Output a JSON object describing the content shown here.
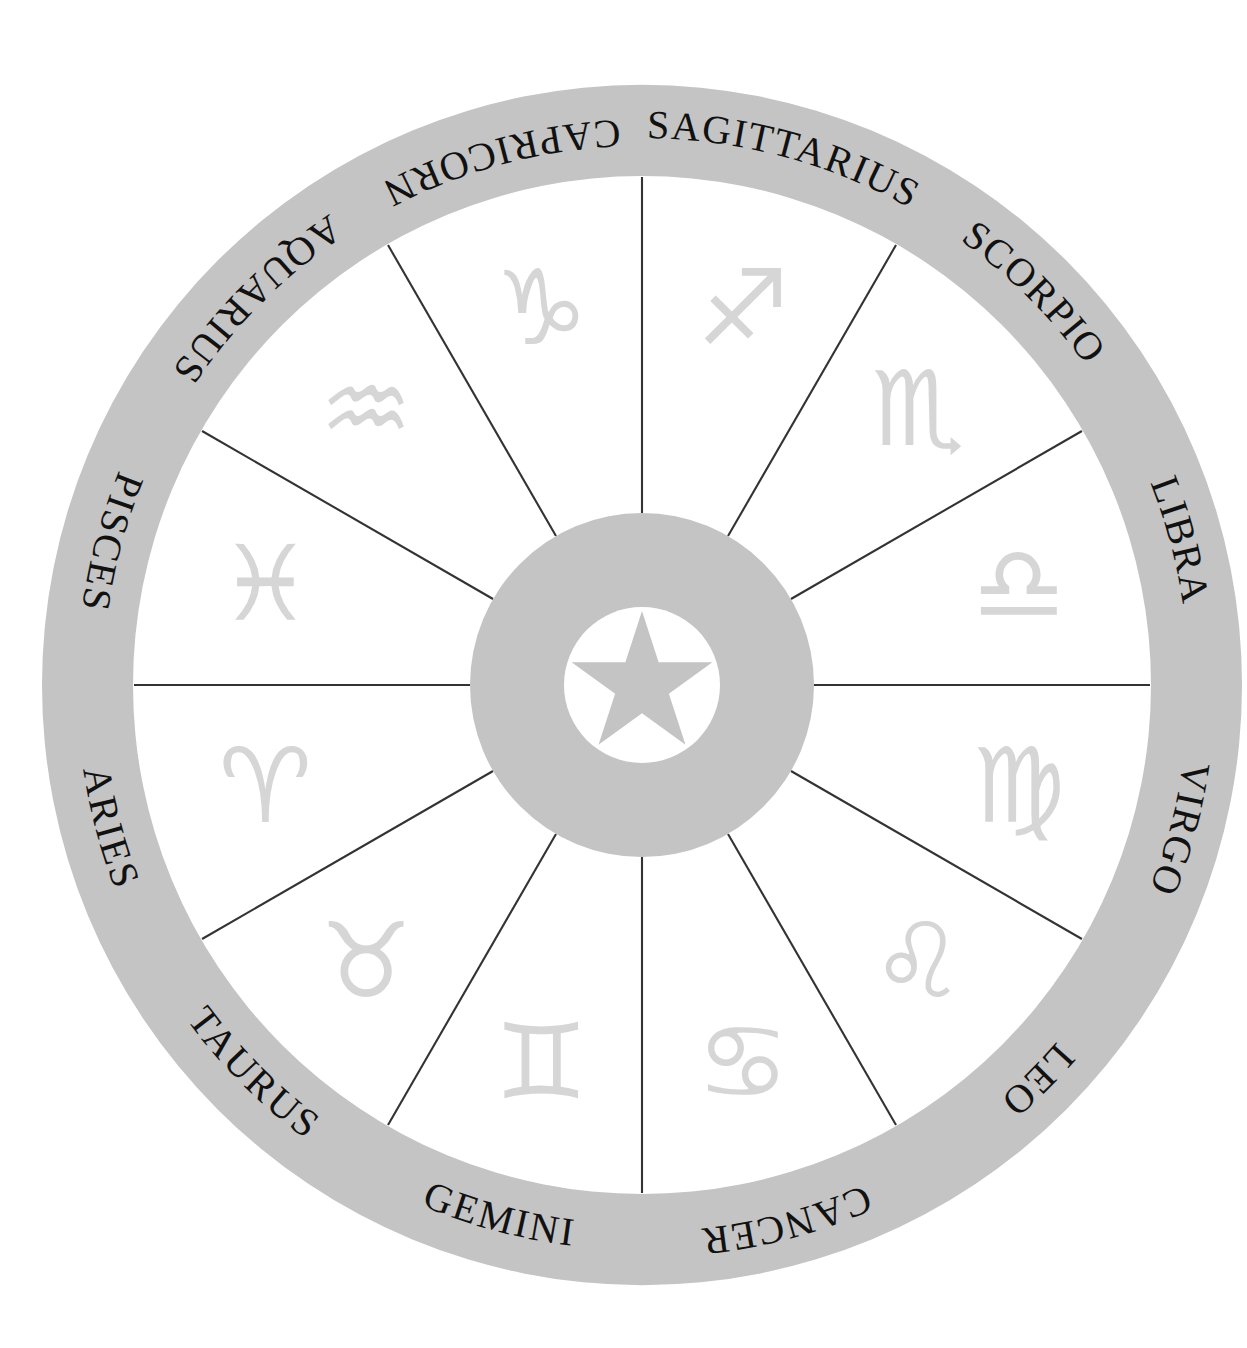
{
  "diagram": {
    "kind": "astrological-zodiac-wheel",
    "segment_count": 12
  },
  "geometry": {
    "center_x": 642,
    "center_y": 685,
    "outer_radius": 600,
    "ring_inner_radius": 508,
    "label_radius": 556,
    "glyph_radius": 390,
    "hub_radius": 172,
    "hub_inner_radius": 78,
    "star_radius": 74,
    "segment_span_degrees": 30,
    "first_segment_start_degrees": 0
  },
  "colors": {
    "background": "#ffffff",
    "ring_band": "#c4c4c4",
    "hub_disc": "#c4c4c4",
    "hub_inner": "#ffffff",
    "hub_star": "#c4c4c4",
    "segment_face": "#ffffff",
    "spoke_line": "#333333",
    "label_text": "#111111",
    "glyph": "#d6d6d6"
  },
  "center_emblem": {
    "name": "five-pointed-star",
    "points": 5
  },
  "signs": [
    {
      "label": "Sagittarius",
      "glyph": "♐",
      "order": 1,
      "start_deg": 0,
      "end_deg": 30,
      "mid_deg": 15
    },
    {
      "label": "Scorpio",
      "glyph": "♏",
      "order": 2,
      "start_deg": 30,
      "end_deg": 60,
      "mid_deg": 45
    },
    {
      "label": "Libra",
      "glyph": "♎",
      "order": 3,
      "start_deg": 60,
      "end_deg": 90,
      "mid_deg": 75
    },
    {
      "label": "Virgo",
      "glyph": "♍",
      "order": 4,
      "start_deg": 90,
      "end_deg": 120,
      "mid_deg": 105
    },
    {
      "label": "Leo",
      "glyph": "♌",
      "order": 5,
      "start_deg": 120,
      "end_deg": 150,
      "mid_deg": 135
    },
    {
      "label": "Cancer",
      "glyph": "♋",
      "order": 6,
      "start_deg": 150,
      "end_deg": 180,
      "mid_deg": 165
    },
    {
      "label": "Gemini",
      "glyph": "♊",
      "order": 7,
      "start_deg": 180,
      "end_deg": 210,
      "mid_deg": 195
    },
    {
      "label": "Taurus",
      "glyph": "♉",
      "order": 8,
      "start_deg": 210,
      "end_deg": 240,
      "mid_deg": 225
    },
    {
      "label": "Aries",
      "glyph": "♈",
      "order": 9,
      "start_deg": 240,
      "end_deg": 270,
      "mid_deg": 255
    },
    {
      "label": "Pisces",
      "glyph": "♓",
      "order": 10,
      "start_deg": 270,
      "end_deg": 300,
      "mid_deg": 285
    },
    {
      "label": "Aquarius",
      "glyph": "♒",
      "order": 11,
      "start_deg": 300,
      "end_deg": 330,
      "mid_deg": 315
    },
    {
      "label": "Capricorn",
      "glyph": "♑",
      "order": 12,
      "start_deg": 330,
      "end_deg": 360,
      "mid_deg": 345
    }
  ]
}
